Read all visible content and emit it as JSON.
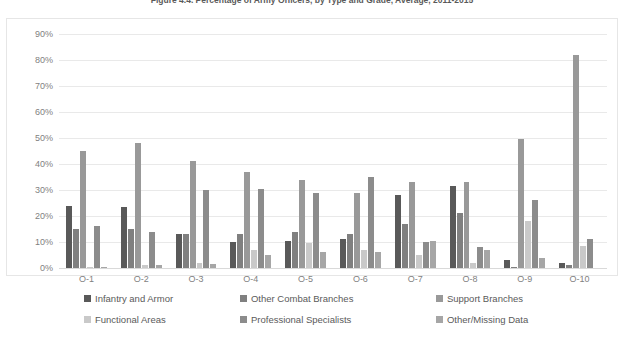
{
  "figure": {
    "title": "Figure 4.4. Percentage of Army Officers, by Type and Grade, Average, 2011-2015"
  },
  "chart_data": {
    "type": "bar",
    "title": "Figure 4.4. Percentage of Army Officers, by Type and Grade, Average, 2011-2015",
    "xlabel": "",
    "ylabel": "",
    "ylim": [
      0,
      90
    ],
    "grid": true,
    "legend_position": "bottom",
    "categories": [
      "O-1",
      "O-2",
      "O-3",
      "O-4",
      "O-5",
      "O-6",
      "O-7",
      "O-8",
      "O-9",
      "O-10"
    ],
    "ytick_labels": [
      "0%",
      "10%",
      "20%",
      "30%",
      "40%",
      "50%",
      "60%",
      "70%",
      "80%",
      "90%"
    ],
    "ytick_values": [
      0,
      10,
      20,
      30,
      40,
      50,
      60,
      70,
      80,
      90
    ],
    "series": [
      {
        "name": "Infantry and Armor",
        "color": "#595959",
        "values": [
          24,
          23.5,
          13,
          10,
          10.5,
          11,
          28,
          31.5,
          3,
          2
        ]
      },
      {
        "name": "Other Combat Branches",
        "color": "#808080",
        "values": [
          15,
          15,
          13,
          13,
          14,
          13,
          17,
          21,
          0.3,
          1
        ]
      },
      {
        "name": "Support Branches",
        "color": "#999999",
        "values": [
          45,
          48,
          41,
          37,
          34,
          29,
          33,
          33,
          49.5,
          82
        ]
      },
      {
        "name": "Functional Areas",
        "color": "#c9c9c9",
        "values": [
          0.5,
          1,
          2,
          7,
          9.5,
          7,
          5,
          2,
          18,
          8.5
        ]
      },
      {
        "name": "Professional Specialists",
        "color": "#8c8c8c",
        "values": [
          16,
          14,
          30,
          30.5,
          29,
          35,
          10,
          8,
          26,
          11
        ]
      },
      {
        "name": "Other/Missing Data",
        "color": "#a6a6a6",
        "values": [
          0.5,
          1,
          1.5,
          5,
          6,
          6,
          10.5,
          7,
          4,
          0
        ]
      }
    ]
  }
}
